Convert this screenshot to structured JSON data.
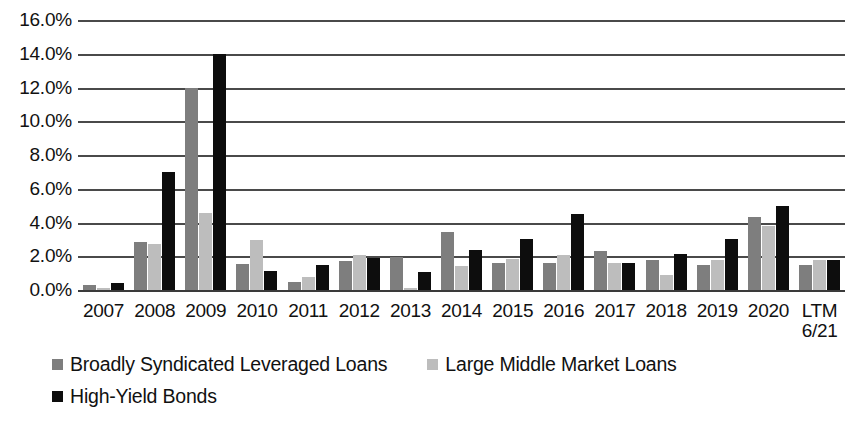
{
  "chart_data": {
    "type": "bar",
    "title": "",
    "subtitle": "",
    "xlabel": "",
    "ylabel": "",
    "ylim": [
      0,
      16
    ],
    "ytick_values": [
      16.0,
      14.0,
      12.0,
      10.0,
      8.0,
      6.0,
      4.0,
      2.0,
      0.0
    ],
    "ytick_labels": [
      "16.0%",
      "14.0%",
      "12.0%",
      "10.0%",
      "8.0%",
      "6.0%",
      "4.0%",
      "2.0%",
      "0.0%"
    ],
    "grid": true,
    "legend_position": "bottom-left",
    "categories": [
      "2007",
      "2008",
      "2009",
      "2010",
      "2011",
      "2012",
      "2013",
      "2014",
      "2015",
      "2016",
      "2017",
      "2018",
      "2019",
      "2020",
      "LTM 6/21"
    ],
    "category_lines": [
      {
        "l1": "2007",
        "l2": ""
      },
      {
        "l1": "2008",
        "l2": ""
      },
      {
        "l1": "2009",
        "l2": ""
      },
      {
        "l1": "2010",
        "l2": ""
      },
      {
        "l1": "2011",
        "l2": ""
      },
      {
        "l1": "2012",
        "l2": ""
      },
      {
        "l1": "2013",
        "l2": ""
      },
      {
        "l1": "2014",
        "l2": ""
      },
      {
        "l1": "2015",
        "l2": ""
      },
      {
        "l1": "2016",
        "l2": ""
      },
      {
        "l1": "2017",
        "l2": ""
      },
      {
        "l1": "2018",
        "l2": ""
      },
      {
        "l1": "2019",
        "l2": ""
      },
      {
        "l1": "2020",
        "l2": ""
      },
      {
        "l1": "LTM",
        "l2": "6/21"
      }
    ],
    "series": [
      {
        "name": "Broadly Syndicated Leveraged Loans",
        "color": "#7e7e7e",
        "values": [
          0.3,
          2.85,
          12.0,
          1.55,
          0.5,
          1.7,
          1.95,
          3.45,
          1.6,
          1.6,
          2.3,
          1.8,
          1.5,
          4.3,
          1.5
        ]
      },
      {
        "name": "Large Middle Market Loans",
        "color": "#bdbdbd",
        "values": [
          0.1,
          2.75,
          4.55,
          2.95,
          0.8,
          2.1,
          0.1,
          1.4,
          1.85,
          2.05,
          1.6,
          0.9,
          1.75,
          3.8,
          1.75
        ]
      },
      {
        "name": "High-Yield Bonds",
        "color": "#0d0d0d",
        "values": [
          0.4,
          7.0,
          14.0,
          1.15,
          1.5,
          1.9,
          1.05,
          2.35,
          3.0,
          4.5,
          1.6,
          2.15,
          3.0,
          5.0,
          1.75
        ]
      }
    ]
  }
}
